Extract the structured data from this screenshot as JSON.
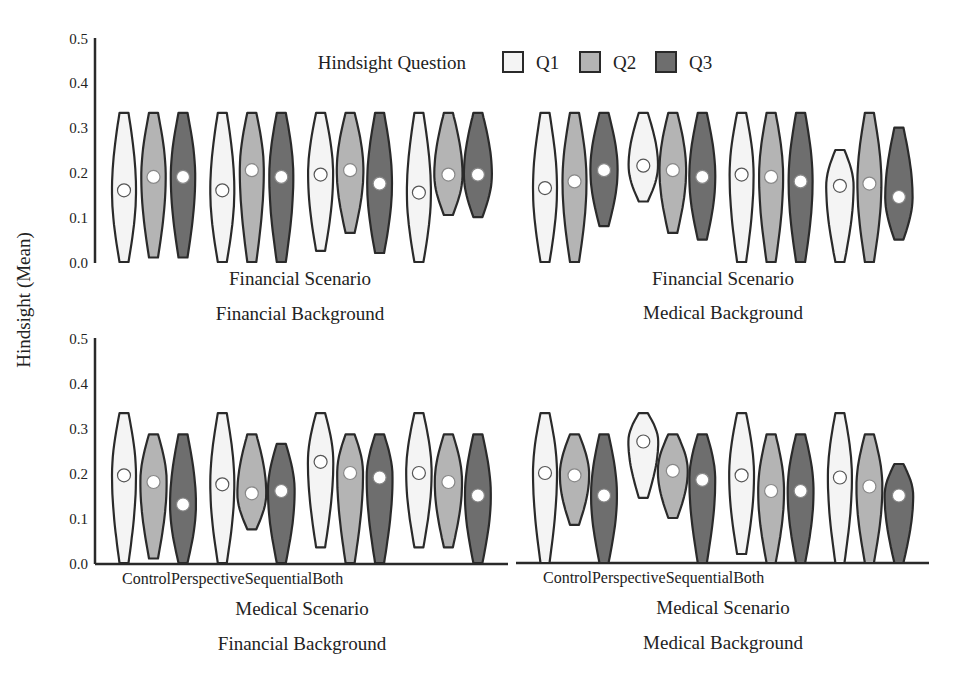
{
  "colors": {
    "Q1": "#f4f4f4",
    "Q2": "#b4b4b4",
    "Q3": "#6e6e6e",
    "stroke": "#2a2a2a",
    "mean_fill": "#ffffff"
  },
  "legend": {
    "title": "Hindsight Question",
    "items": [
      {
        "label": "Q1",
        "key": "Q1"
      },
      {
        "label": "Q2",
        "key": "Q2"
      },
      {
        "label": "Q3",
        "key": "Q3"
      }
    ]
  },
  "ylabel": "Hindsight (Mean)",
  "yticks": [
    "0.0",
    "0.1",
    "0.2",
    "0.3",
    "0.4",
    "0.5"
  ],
  "conditions_label": "ControlPerspectiveSequentialBoth",
  "panels": [
    {
      "id": "ff",
      "line1": "Financial Scenario",
      "line2": "Financial Background"
    },
    {
      "id": "fm",
      "line1": "Financial Scenario",
      "line2": "Medical Background"
    },
    {
      "id": "mf",
      "line1": "Medical Scenario",
      "line2": "Financial Background"
    },
    {
      "id": "mm",
      "line1": "Medical Scenario",
      "line2": "Medical Background"
    }
  ],
  "chart_data": {
    "type": "violin",
    "title": "",
    "ylabel": "Hindsight (Mean)",
    "ylim": [
      0,
      0.5
    ],
    "categories": [
      "Control",
      "Perspective",
      "Sequential",
      "Both"
    ],
    "hue": [
      "Q1",
      "Q2",
      "Q3"
    ],
    "legend_title": "Hindsight Question",
    "legend_position": "top",
    "facets": [
      {
        "scenario": "Financial Scenario",
        "background": "Financial Background",
        "violins": [
          {
            "cond": "Control",
            "q": "Q1",
            "min": 0.0,
            "max": 0.333,
            "mean": 0.16
          },
          {
            "cond": "Control",
            "q": "Q2",
            "min": 0.01,
            "max": 0.333,
            "mean": 0.19
          },
          {
            "cond": "Control",
            "q": "Q3",
            "min": 0.01,
            "max": 0.333,
            "mean": 0.19
          },
          {
            "cond": "Perspective",
            "q": "Q1",
            "min": 0.0,
            "max": 0.333,
            "mean": 0.16
          },
          {
            "cond": "Perspective",
            "q": "Q2",
            "min": 0.0,
            "max": 0.333,
            "mean": 0.205
          },
          {
            "cond": "Perspective",
            "q": "Q3",
            "min": 0.0,
            "max": 0.333,
            "mean": 0.19
          },
          {
            "cond": "Sequential",
            "q": "Q1",
            "min": 0.025,
            "max": 0.333,
            "mean": 0.195
          },
          {
            "cond": "Sequential",
            "q": "Q2",
            "min": 0.065,
            "max": 0.333,
            "mean": 0.205
          },
          {
            "cond": "Sequential",
            "q": "Q3",
            "min": 0.02,
            "max": 0.333,
            "mean": 0.175
          },
          {
            "cond": "Both",
            "q": "Q1",
            "min": 0.0,
            "max": 0.333,
            "mean": 0.155
          },
          {
            "cond": "Both",
            "q": "Q2",
            "min": 0.105,
            "max": 0.333,
            "mean": 0.195
          },
          {
            "cond": "Both",
            "q": "Q3",
            "min": 0.1,
            "max": 0.333,
            "mean": 0.195
          }
        ]
      },
      {
        "scenario": "Financial Scenario",
        "background": "Medical Background",
        "violins": [
          {
            "cond": "Control",
            "q": "Q1",
            "min": 0.0,
            "max": 0.333,
            "mean": 0.165
          },
          {
            "cond": "Control",
            "q": "Q2",
            "min": 0.0,
            "max": 0.333,
            "mean": 0.18
          },
          {
            "cond": "Control",
            "q": "Q3",
            "min": 0.08,
            "max": 0.333,
            "mean": 0.205
          },
          {
            "cond": "Perspective",
            "q": "Q1",
            "min": 0.135,
            "max": 0.333,
            "mean": 0.215
          },
          {
            "cond": "Perspective",
            "q": "Q2",
            "min": 0.065,
            "max": 0.333,
            "mean": 0.205
          },
          {
            "cond": "Perspective",
            "q": "Q3",
            "min": 0.05,
            "max": 0.333,
            "mean": 0.19
          },
          {
            "cond": "Sequential",
            "q": "Q1",
            "min": 0.0,
            "max": 0.333,
            "mean": 0.195
          },
          {
            "cond": "Sequential",
            "q": "Q2",
            "min": 0.0,
            "max": 0.333,
            "mean": 0.19
          },
          {
            "cond": "Sequential",
            "q": "Q3",
            "min": 0.0,
            "max": 0.333,
            "mean": 0.18
          },
          {
            "cond": "Both",
            "q": "Q1",
            "min": 0.0,
            "max": 0.25,
            "mean": 0.17
          },
          {
            "cond": "Both",
            "q": "Q2",
            "min": 0.0,
            "max": 0.333,
            "mean": 0.175
          },
          {
            "cond": "Both",
            "q": "Q3",
            "min": 0.05,
            "max": 0.3,
            "mean": 0.145
          }
        ]
      },
      {
        "scenario": "Medical Scenario",
        "background": "Financial Background",
        "violins": [
          {
            "cond": "Control",
            "q": "Q1",
            "min": 0.0,
            "max": 0.333,
            "mean": 0.195
          },
          {
            "cond": "Control",
            "q": "Q2",
            "min": 0.01,
            "max": 0.286,
            "mean": 0.18
          },
          {
            "cond": "Control",
            "q": "Q3",
            "min": 0.0,
            "max": 0.286,
            "mean": 0.13
          },
          {
            "cond": "Perspective",
            "q": "Q1",
            "min": 0.0,
            "max": 0.333,
            "mean": 0.175
          },
          {
            "cond": "Perspective",
            "q": "Q2",
            "min": 0.075,
            "max": 0.286,
            "mean": 0.155
          },
          {
            "cond": "Perspective",
            "q": "Q3",
            "min": 0.0,
            "max": 0.265,
            "mean": 0.16
          },
          {
            "cond": "Sequential",
            "q": "Q1",
            "min": 0.035,
            "max": 0.333,
            "mean": 0.225
          },
          {
            "cond": "Sequential",
            "q": "Q2",
            "min": 0.0,
            "max": 0.286,
            "mean": 0.2
          },
          {
            "cond": "Sequential",
            "q": "Q3",
            "min": 0.0,
            "max": 0.286,
            "mean": 0.19
          },
          {
            "cond": "Both",
            "q": "Q1",
            "min": 0.035,
            "max": 0.333,
            "mean": 0.2
          },
          {
            "cond": "Both",
            "q": "Q2",
            "min": 0.035,
            "max": 0.286,
            "mean": 0.18
          },
          {
            "cond": "Both",
            "q": "Q3",
            "min": 0.0,
            "max": 0.286,
            "mean": 0.15
          }
        ]
      },
      {
        "scenario": "Medical Scenario",
        "background": "Medical Background",
        "violins": [
          {
            "cond": "Control",
            "q": "Q1",
            "min": 0.0,
            "max": 0.333,
            "mean": 0.2
          },
          {
            "cond": "Control",
            "q": "Q2",
            "min": 0.085,
            "max": 0.286,
            "mean": 0.195
          },
          {
            "cond": "Control",
            "q": "Q3",
            "min": 0.0,
            "max": 0.286,
            "mean": 0.15
          },
          {
            "cond": "Perspective",
            "q": "Q1",
            "min": 0.145,
            "max": 0.333,
            "mean": 0.27
          },
          {
            "cond": "Perspective",
            "q": "Q2",
            "min": 0.1,
            "max": 0.286,
            "mean": 0.205
          },
          {
            "cond": "Perspective",
            "q": "Q3",
            "min": 0.0,
            "max": 0.286,
            "mean": 0.185
          },
          {
            "cond": "Sequential",
            "q": "Q1",
            "min": 0.02,
            "max": 0.333,
            "mean": 0.195
          },
          {
            "cond": "Sequential",
            "q": "Q2",
            "min": 0.0,
            "max": 0.286,
            "mean": 0.16
          },
          {
            "cond": "Sequential",
            "q": "Q3",
            "min": 0.0,
            "max": 0.286,
            "mean": 0.16
          },
          {
            "cond": "Both",
            "q": "Q1",
            "min": 0.0,
            "max": 0.333,
            "mean": 0.19
          },
          {
            "cond": "Both",
            "q": "Q2",
            "min": 0.0,
            "max": 0.286,
            "mean": 0.17
          },
          {
            "cond": "Both",
            "q": "Q3",
            "min": 0.0,
            "max": 0.22,
            "mean": 0.15
          }
        ]
      }
    ]
  }
}
